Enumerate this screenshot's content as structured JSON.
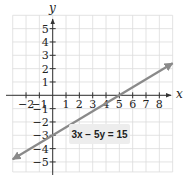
{
  "chart_data": {
    "type": "line",
    "title": "",
    "xlabel": "x",
    "ylabel": "y",
    "xlim": [
      -3,
      9
    ],
    "ylim": [
      -5.75,
      6
    ],
    "grid": true,
    "x_ticks": [
      -2,
      -1,
      1,
      2,
      3,
      4,
      5,
      6,
      7,
      8
    ],
    "y_ticks": [
      -5,
      -4,
      -3,
      -2,
      -1,
      1,
      2,
      3,
      4,
      5
    ],
    "series": [
      {
        "name": "3x − 5y = 15",
        "equation": "3x − 5y = 15",
        "x": [
          -3,
          0,
          5,
          9
        ],
        "y": [
          -4.8,
          -3,
          0,
          2.4
        ],
        "color": "#8a8a8a",
        "arrows": "both"
      }
    ],
    "annotations": [
      {
        "text": "3x − 5y = 15",
        "x": 4,
        "y": -3
      }
    ],
    "intercepts": {
      "x_intercept": 5,
      "y_intercept": -3
    }
  },
  "labels": {
    "x_axis": "x",
    "y_axis": "y",
    "equation": "3x − 5y = 15"
  },
  "colors": {
    "grid": "#dcdcdc",
    "axis": "#333333",
    "line": "#8a8a8a",
    "label_bg": "#ededed"
  }
}
